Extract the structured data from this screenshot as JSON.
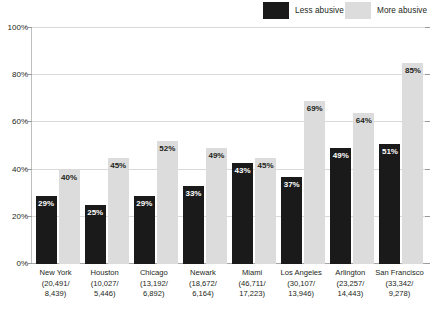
{
  "legend": {
    "items": [
      {
        "label": "Less abusive",
        "color": "#1a1a1a",
        "key": "less"
      },
      {
        "label": "More abusive",
        "color": "#dcdcdc",
        "key": "more"
      }
    ]
  },
  "axis": {
    "y_ticks": [
      "0%",
      "20%",
      "40%",
      "60%",
      "80%",
      "100%"
    ]
  },
  "chart_data": {
    "type": "bar",
    "title": "",
    "subtitle": "",
    "xlabel": "",
    "ylabel": "",
    "ylim": [
      0,
      100
    ],
    "grid": true,
    "legend_position": "top-right",
    "categories": [
      "New York",
      "Houston",
      "Chicago",
      "Newark",
      "Miami",
      "Los Angeles",
      "Arlington",
      "San Francisco"
    ],
    "category_counts": [
      "(20,491/\n8,439)",
      "(10,027/\n5,446)",
      "(13,192/\n6,892)",
      "(18,672/\n6,164)",
      "(46,711/\n17,223)",
      "(30,107/\n13,946)",
      "(23,257/\n14,443)",
      "(33,342/\n9,278)"
    ],
    "category_counts_line1": [
      "(20,491/",
      "(10,027/",
      "(13,192/",
      "(18,672/",
      "(46,711/",
      "(30,107/",
      "(23,257/",
      "(33,342/"
    ],
    "category_counts_line2": [
      "8,439)",
      "5,446)",
      "6,892)",
      "6,164)",
      "17,223)",
      "13,946)",
      "14,443)",
      "9,278)"
    ],
    "series": [
      {
        "name": "Less abusive",
        "color": "#1a1a1a",
        "values": [
          29,
          25,
          29,
          33,
          43,
          37,
          49,
          51
        ],
        "labels": [
          "29%",
          "25%",
          "29%",
          "33%",
          "43%",
          "37%",
          "49%",
          "51%"
        ]
      },
      {
        "name": "More abusive",
        "color": "#dcdcdc",
        "values": [
          40,
          45,
          52,
          49,
          45,
          69,
          64,
          85
        ],
        "labels": [
          "40%",
          "45%",
          "52%",
          "49%",
          "45%",
          "69%",
          "64%",
          "85%"
        ]
      }
    ]
  },
  "colors": {
    "less_abusive": "#1a1a1a",
    "more_abusive": "#dcdcdc",
    "gridline": "#d9d9d9",
    "axis": "#bfbfbf",
    "text": "#231f20",
    "background": "#ffffff"
  }
}
